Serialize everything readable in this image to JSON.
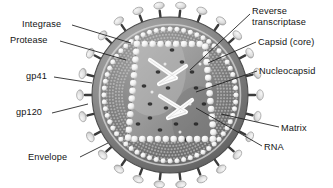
{
  "figure": {
    "colors": {
      "background": "#ffffff",
      "text": "#141414",
      "leader_line": "#1a1a1a",
      "envelope_outer": "#6e6e6e",
      "envelope_inner": "#8f8f8f",
      "matrix_band": "#7a7a7a",
      "matrix_bead": "#efefef",
      "capsid_core": "#9a9a9a",
      "capsid_bead": "#f2f2f2",
      "rna_strand": "#fbfbfb",
      "spike_knob": "#e6e6e6",
      "spike_stalk": "#3b3b3b"
    }
  },
  "labels": {
    "left": [
      {
        "id": "integrase",
        "text": "Integrase",
        "x": 22,
        "y": 19
      },
      {
        "id": "protease",
        "text": "Protease",
        "x": 10,
        "y": 35
      },
      {
        "id": "gp41",
        "text": "gp41",
        "x": 26,
        "y": 71
      },
      {
        "id": "gp120",
        "text": "gp120",
        "x": 16,
        "y": 107
      },
      {
        "id": "envelope",
        "text": "Envelope",
        "x": 28,
        "y": 152
      }
    ],
    "right": [
      {
        "id": "reverse-transcriptase",
        "text": "Reverse\ntranscriptase",
        "x": 252,
        "y": 6
      },
      {
        "id": "capsid-core",
        "text": "Capsid (core)",
        "x": 258,
        "y": 37
      },
      {
        "id": "nucleocapsid",
        "text": "Nucleocapsid",
        "x": 259,
        "y": 66
      },
      {
        "id": "matrix",
        "text": "Matrix",
        "x": 281,
        "y": 123
      },
      {
        "id": "rna",
        "text": "RNA",
        "x": 264,
        "y": 142
      }
    ]
  },
  "leader_lines": [
    {
      "id": "integrase-leader",
      "x1": 72,
      "y1": 25,
      "x2": 131,
      "y2": 43
    },
    {
      "id": "protease-leader",
      "x1": 60,
      "y1": 41,
      "x2": 126,
      "y2": 60
    },
    {
      "id": "gp41-leader",
      "x1": 54,
      "y1": 77,
      "x2": 92,
      "y2": 83
    },
    {
      "id": "gp120-leader",
      "x1": 52,
      "y1": 113,
      "x2": 88,
      "y2": 104
    },
    {
      "id": "envelope-leader",
      "x1": 80,
      "y1": 157,
      "x2": 108,
      "y2": 143
    },
    {
      "id": "rt-leader",
      "x1": 250,
      "y1": 14,
      "x2": 190,
      "y2": 70
    },
    {
      "id": "capsid-leader",
      "x1": 256,
      "y1": 42,
      "x2": 208,
      "y2": 63
    },
    {
      "id": "nucleocapsid-leader",
      "x1": 257,
      "y1": 71,
      "x2": 196,
      "y2": 92
    },
    {
      "id": "matrix-leader",
      "x1": 279,
      "y1": 127,
      "x2": 221,
      "y2": 114
    },
    {
      "id": "rna-leader",
      "x1": 262,
      "y1": 146,
      "x2": 196,
      "y2": 108
    }
  ],
  "virion": {
    "center_x": 170,
    "center_y": 95,
    "radius_envelope": 78,
    "radius_spike_tip": 92,
    "spike_count": 26,
    "matrix_bead_count": 60,
    "capsid_bead_count": 44,
    "layers": [
      {
        "name": "envelope",
        "label_ref": "envelope"
      },
      {
        "name": "gp120-spike",
        "label_ref": "gp120"
      },
      {
        "name": "gp41-stalk",
        "label_ref": "gp41"
      },
      {
        "name": "matrix",
        "label_ref": "matrix"
      },
      {
        "name": "capsid-core",
        "label_ref": "capsid-core"
      },
      {
        "name": "rna",
        "label_ref": "rna"
      },
      {
        "name": "nucleocapsid",
        "label_ref": "nucleocapsid"
      },
      {
        "name": "reverse-transcriptase",
        "label_ref": "reverse-transcriptase"
      },
      {
        "name": "integrase",
        "label_ref": "integrase"
      },
      {
        "name": "protease",
        "label_ref": "protease"
      }
    ]
  }
}
